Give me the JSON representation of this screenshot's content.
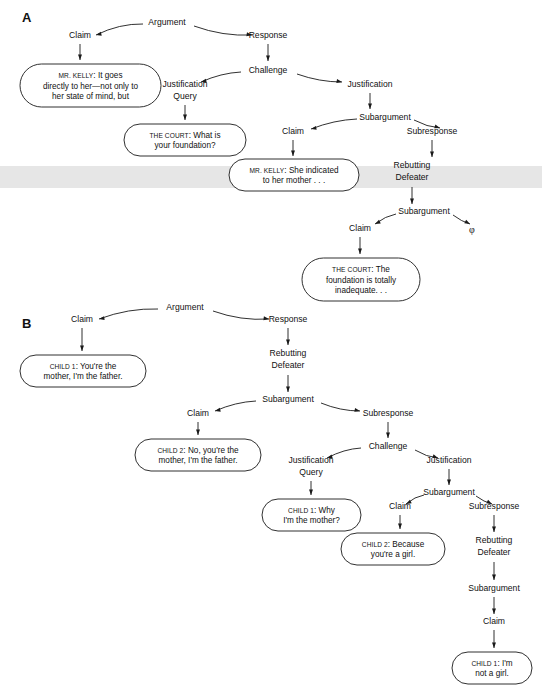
{
  "figure": {
    "type": "argument-structure-diagram",
    "background": "#ffffff",
    "ink_color": "#1a1a1a",
    "highlight_band_color": "#e6e6e6",
    "panels": [
      {
        "id": "A",
        "label": "A"
      },
      {
        "id": "B",
        "label": "B"
      }
    ]
  },
  "highlight_band": {
    "y": 166,
    "height": 22
  },
  "nodes": {
    "a": [
      {
        "id": "a-argument",
        "label": "Argument",
        "x": 167,
        "y": 25
      },
      {
        "id": "a-claim",
        "label": "Claim",
        "x": 80,
        "y": 38
      },
      {
        "id": "a-response",
        "label": "Response",
        "x": 268,
        "y": 38
      },
      {
        "id": "a-challenge",
        "label": "Challenge",
        "x": 268,
        "y": 73
      },
      {
        "id": "a-justification-query-1",
        "label": "Justification",
        "x": 185,
        "y": 87
      },
      {
        "id": "a-justification-query-2",
        "label": "Query",
        "x": 185,
        "y": 99
      },
      {
        "id": "a-justification",
        "label": "Justification",
        "x": 370,
        "y": 87
      },
      {
        "id": "a-subargument",
        "label": "Subargument",
        "x": 385,
        "y": 120
      },
      {
        "id": "a-claim-2",
        "label": "Claim",
        "x": 293,
        "y": 134
      },
      {
        "id": "a-subresponse",
        "label": "Subresponse",
        "x": 432,
        "y": 134
      },
      {
        "id": "a-rebutting-1",
        "label": "Rebutting",
        "x": 412,
        "y": 168
      },
      {
        "id": "a-rebutting-2",
        "label": "Defeater",
        "x": 412,
        "y": 180
      },
      {
        "id": "a-subargument-2",
        "label": "Subargument",
        "x": 424,
        "y": 214
      },
      {
        "id": "a-claim-3",
        "label": "Claim",
        "x": 360,
        "y": 231
      }
    ],
    "b": [
      {
        "id": "b-argument",
        "label": "Argument",
        "x": 185,
        "y": 310
      },
      {
        "id": "b-claim",
        "label": "Claim",
        "x": 82,
        "y": 322
      },
      {
        "id": "b-response",
        "label": "Response",
        "x": 288,
        "y": 322
      },
      {
        "id": "b-rebutting-1",
        "label": "Rebutting",
        "x": 288,
        "y": 356
      },
      {
        "id": "b-rebutting-2",
        "label": "Defeater",
        "x": 288,
        "y": 368
      },
      {
        "id": "b-subargument",
        "label": "Subargument",
        "x": 288,
        "y": 402
      },
      {
        "id": "b-claim-2",
        "label": "Claim",
        "x": 198,
        "y": 416
      },
      {
        "id": "b-subresponse",
        "label": "Subresponse",
        "x": 388,
        "y": 416
      },
      {
        "id": "b-challenge",
        "label": "Challenge",
        "x": 388,
        "y": 449
      },
      {
        "id": "b-justification-query-1",
        "label": "Justification",
        "x": 311,
        "y": 463
      },
      {
        "id": "b-justification-query-2",
        "label": "Query",
        "x": 311,
        "y": 475
      },
      {
        "id": "b-justification",
        "label": "Justification",
        "x": 449,
        "y": 463
      },
      {
        "id": "b-subargument-2",
        "label": "Subargument",
        "x": 449,
        "y": 495
      },
      {
        "id": "b-claim-3",
        "label": "Claim",
        "x": 400,
        "y": 509
      },
      {
        "id": "b-subresponse-2",
        "label": "Subresponse",
        "x": 494,
        "y": 509
      },
      {
        "id": "b-rebutting-3",
        "label": "Rebutting",
        "x": 494,
        "y": 543
      },
      {
        "id": "b-rebutting-4",
        "label": "Defeater",
        "x": 494,
        "y": 555
      },
      {
        "id": "b-subargument-3",
        "label": "Subargument",
        "x": 494,
        "y": 591
      },
      {
        "id": "b-claim-4",
        "label": "Claim",
        "x": 494,
        "y": 624
      }
    ]
  },
  "empty_symbol": {
    "id": "a-phi",
    "label": "φ",
    "x": 472,
    "y": 233
  },
  "bubbles": [
    {
      "id": "a-bubble-claim",
      "speaker": "MR. KELLY",
      "lines": [
        "MR. KELLY: It goes",
        "directly to her—not only to",
        "her state of mind, but"
      ],
      "x": 20,
      "y": 64,
      "width": 141,
      "height": 43,
      "highlighted": false
    },
    {
      "id": "a-bubble-court-foundation",
      "speaker": "THE COURT",
      "lines": [
        "THE COURT: What is",
        "your foundation?"
      ],
      "x": 124,
      "y": 124,
      "width": 122,
      "height": 32,
      "highlighted": false
    },
    {
      "id": "a-bubble-kelly-indicated",
      "speaker": "MR. KELLY",
      "lines": [
        "MR. KELLY: She indicated",
        "to her mother . . ."
      ],
      "x": 229,
      "y": 159,
      "width": 130,
      "height": 32,
      "highlighted": true
    },
    {
      "id": "a-bubble-court-inadequate",
      "speaker": "THE COURT",
      "lines": [
        "THE COURT: The",
        "foundation is totally",
        "inadequate. . ."
      ],
      "x": 302,
      "y": 258,
      "width": 118,
      "height": 43,
      "highlighted": false
    },
    {
      "id": "b-bubble-child1-mother-father",
      "speaker": "CHILD 1",
      "lines": [
        "CHILD 1: You're the",
        "mother, I'm the father."
      ],
      "x": 20,
      "y": 355,
      "width": 126,
      "height": 32,
      "highlighted": false
    },
    {
      "id": "b-bubble-child2-no-mother-father",
      "speaker": "CHILD 2",
      "lines": [
        "CHILD 2: No, you're the",
        "mother, I'm the father."
      ],
      "x": 135,
      "y": 439,
      "width": 126,
      "height": 32,
      "highlighted": false
    },
    {
      "id": "b-bubble-child1-why",
      "speaker": "CHILD 1",
      "lines": [
        "CHILD 1: Why",
        "I'm the mother?"
      ],
      "x": 262,
      "y": 499,
      "width": 99,
      "height": 32,
      "highlighted": false
    },
    {
      "id": "b-bubble-child2-because",
      "speaker": "CHILD 2",
      "lines": [
        "CHILD 2: Because",
        "you're a girl."
      ],
      "x": 341,
      "y": 533,
      "width": 104,
      "height": 32,
      "highlighted": false
    },
    {
      "id": "b-bubble-child1-not-a-girl",
      "speaker": "CHILD 1",
      "lines": [
        "CHILD 1: I'm",
        "not a girl."
      ],
      "x": 452,
      "y": 652,
      "width": 80,
      "height": 32,
      "highlighted": false
    }
  ],
  "edges": [
    {
      "id": "a-e1",
      "from": "a-argument",
      "to": "a-claim",
      "x1": 143,
      "y1": 24,
      "x2": 96,
      "y2": 35,
      "style": "curve",
      "bend": -6
    },
    {
      "id": "a-e2",
      "from": "a-argument",
      "to": "a-response",
      "x1": 194,
      "y1": 26,
      "x2": 252,
      "y2": 35,
      "style": "curve",
      "bend": 6
    },
    {
      "id": "a-e3",
      "from": "a-claim",
      "to": "a-bubble-claim",
      "x1": 80,
      "y1": 44,
      "x2": 80,
      "y2": 60,
      "style": "straight"
    },
    {
      "id": "a-e4",
      "from": "a-response",
      "to": "a-challenge",
      "x1": 268,
      "y1": 44,
      "x2": 268,
      "y2": 61,
      "style": "straight"
    },
    {
      "id": "a-e5",
      "from": "a-challenge",
      "to": "a-justification-query-1",
      "x1": 241,
      "y1": 72,
      "x2": 201,
      "y2": 82,
      "style": "curve",
      "bend": -4
    },
    {
      "id": "a-e6",
      "from": "a-challenge",
      "to": "a-justification",
      "x1": 297,
      "y1": 74,
      "x2": 342,
      "y2": 82,
      "style": "curve",
      "bend": 4
    },
    {
      "id": "a-e7",
      "from": "a-justification-query-2",
      "to": "a-bubble-court-foundation",
      "x1": 185,
      "y1": 105,
      "x2": 185,
      "y2": 120,
      "style": "straight"
    },
    {
      "id": "a-e8",
      "from": "a-justification",
      "to": "a-subargument",
      "x1": 370,
      "y1": 93,
      "x2": 370,
      "y2": 109,
      "style": "straight"
    },
    {
      "id": "a-e9",
      "from": "a-subargument",
      "to": "a-claim-2",
      "x1": 357,
      "y1": 119,
      "x2": 311,
      "y2": 129,
      "style": "curve",
      "bend": -4
    },
    {
      "id": "a-e10",
      "from": "a-subargument",
      "to": "a-subresponse",
      "x1": 414,
      "y1": 120,
      "x2": 440,
      "y2": 128,
      "style": "curve",
      "bend": 3
    },
    {
      "id": "a-e11",
      "from": "a-claim-2",
      "to": "a-bubble-kelly-indicated",
      "x1": 293,
      "y1": 140,
      "x2": 293,
      "y2": 156,
      "style": "straight"
    },
    {
      "id": "a-e12",
      "from": "a-subresponse",
      "to": "a-rebutting-1",
      "x1": 432,
      "y1": 140,
      "x2": 432,
      "y2": 157,
      "style": "straight"
    },
    {
      "id": "a-e13",
      "from": "a-rebutting-2",
      "to": "a-subargument-2",
      "x1": 412,
      "y1": 187,
      "x2": 412,
      "y2": 204,
      "style": "straight"
    },
    {
      "id": "a-e14",
      "from": "a-subargument-2",
      "to": "a-claim-3",
      "x1": 396,
      "y1": 214,
      "x2": 375,
      "y2": 224,
      "style": "curve",
      "bend": -3
    },
    {
      "id": "a-e15",
      "from": "a-subargument-2",
      "to": "a-phi",
      "x1": 453,
      "y1": 215,
      "x2": 470,
      "y2": 224,
      "style": "curve",
      "bend": 2
    },
    {
      "id": "a-e16",
      "from": "a-claim-3",
      "to": "a-bubble-court-inadequate",
      "x1": 360,
      "y1": 237,
      "x2": 360,
      "y2": 254,
      "style": "straight"
    },
    {
      "id": "b-e1",
      "from": "b-argument",
      "to": "b-claim",
      "x1": 158,
      "y1": 309,
      "x2": 99,
      "y2": 319,
      "style": "curve",
      "bend": -6
    },
    {
      "id": "b-e2",
      "from": "b-argument",
      "to": "b-response",
      "x1": 213,
      "y1": 311,
      "x2": 269,
      "y2": 319,
      "style": "curve",
      "bend": 6
    },
    {
      "id": "b-e3",
      "from": "b-claim",
      "to": "b-bubble-child1-mother-father",
      "x1": 82,
      "y1": 328,
      "x2": 82,
      "y2": 351,
      "style": "straight"
    },
    {
      "id": "b-e4",
      "from": "b-response",
      "to": "b-rebutting-1",
      "x1": 288,
      "y1": 328,
      "x2": 288,
      "y2": 345,
      "style": "straight"
    },
    {
      "id": "b-e5",
      "from": "b-rebutting-2",
      "to": "b-subargument",
      "x1": 288,
      "y1": 375,
      "x2": 288,
      "y2": 392,
      "style": "straight"
    },
    {
      "id": "b-e6",
      "from": "b-subargument",
      "to": "b-claim-2",
      "x1": 256,
      "y1": 401,
      "x2": 215,
      "y2": 411,
      "style": "curve",
      "bend": -4
    },
    {
      "id": "b-e7",
      "from": "b-subargument",
      "to": "b-subresponse",
      "x1": 321,
      "y1": 403,
      "x2": 360,
      "y2": 411,
      "style": "curve",
      "bend": 4
    },
    {
      "id": "b-e8",
      "from": "b-claim-2",
      "to": "b-bubble-child2-no-mother-father",
      "x1": 198,
      "y1": 422,
      "x2": 198,
      "y2": 435,
      "style": "straight"
    },
    {
      "id": "b-e9",
      "from": "b-subresponse",
      "to": "b-challenge",
      "x1": 388,
      "y1": 422,
      "x2": 388,
      "y2": 438,
      "style": "straight"
    },
    {
      "id": "b-e10",
      "from": "b-challenge",
      "to": "b-justification-query-1",
      "x1": 361,
      "y1": 448,
      "x2": 327,
      "y2": 458,
      "style": "curve",
      "bend": -4
    },
    {
      "id": "b-e11",
      "from": "b-challenge",
      "to": "b-justification",
      "x1": 415,
      "y1": 450,
      "x2": 438,
      "y2": 458,
      "style": "curve",
      "bend": 3
    },
    {
      "id": "b-e12",
      "from": "b-justification-query-2",
      "to": "b-bubble-child1-why",
      "x1": 311,
      "y1": 481,
      "x2": 311,
      "y2": 495,
      "style": "straight"
    },
    {
      "id": "b-e13",
      "from": "b-justification",
      "to": "b-subargument-2",
      "x1": 449,
      "y1": 469,
      "x2": 449,
      "y2": 485,
      "style": "straight"
    },
    {
      "id": "b-e14",
      "from": "b-subargument-2",
      "to": "b-claim-3",
      "x1": 424,
      "y1": 495,
      "x2": 406,
      "y2": 504,
      "style": "curve",
      "bend": -3
    },
    {
      "id": "b-e15",
      "from": "b-subargument-2",
      "to": "b-subresponse-2",
      "x1": 476,
      "y1": 496,
      "x2": 492,
      "y2": 504,
      "style": "curve",
      "bend": 2
    },
    {
      "id": "b-e16",
      "from": "b-claim-3",
      "to": "b-bubble-child2-because",
      "x1": 400,
      "y1": 515,
      "x2": 400,
      "y2": 529,
      "style": "straight"
    },
    {
      "id": "b-e17",
      "from": "b-subresponse-2",
      "to": "b-rebutting-3",
      "x1": 494,
      "y1": 515,
      "x2": 494,
      "y2": 532,
      "style": "straight"
    },
    {
      "id": "b-e18",
      "from": "b-rebutting-4",
      "to": "b-subargument-3",
      "x1": 494,
      "y1": 562,
      "x2": 494,
      "y2": 580,
      "style": "straight"
    },
    {
      "id": "b-e19",
      "from": "b-subargument-3",
      "to": "b-claim-4",
      "x1": 494,
      "y1": 597,
      "x2": 494,
      "y2": 614,
      "style": "straight"
    },
    {
      "id": "b-e20",
      "from": "b-claim-4",
      "to": "b-bubble-child1-not-a-girl",
      "x1": 494,
      "y1": 630,
      "x2": 494,
      "y2": 648,
      "style": "straight"
    }
  ],
  "panel_labels": [
    {
      "id": "panel-a-label",
      "label": "A",
      "x": 22,
      "y": 22
    },
    {
      "id": "panel-b-label",
      "label": "B",
      "x": 22,
      "y": 328
    }
  ]
}
